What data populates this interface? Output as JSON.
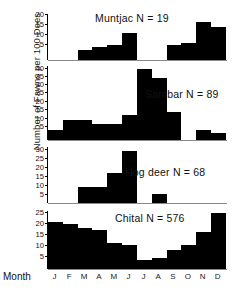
{
  "axis": {
    "ylabel": "Number of Fawns per 100 Does",
    "month_label": "Month",
    "months": [
      "J",
      "F",
      "M",
      "A",
      "M",
      "J",
      "J",
      "A",
      "S",
      "O",
      "N",
      "D"
    ]
  },
  "chart_data": {
    "type": "bar",
    "title": "",
    "xlabel": "Month",
    "ylabel": "Number of Fawns per 100 Does",
    "grid": false,
    "legend": "none",
    "categories": [
      "J",
      "F",
      "M",
      "A",
      "M",
      "J",
      "J",
      "A",
      "S",
      "O",
      "N",
      "D"
    ],
    "panels": [
      {
        "name": "Muntjac",
        "label": "Muntjac N = 19",
        "n": 19,
        "ylim": [
          0,
          22
        ],
        "yticks": [
          5,
          10,
          15,
          20
        ],
        "ytick_labels": [
          "5",
          "10",
          "15",
          "20"
        ],
        "values": [
          0,
          0,
          5,
          6,
          7,
          13,
          0,
          0,
          7,
          8,
          18,
          16
        ]
      },
      {
        "name": "Sambar",
        "label": "Sambar N = 89",
        "n": 89,
        "ylim": [
          0,
          45
        ],
        "yticks": [
          5,
          10,
          15,
          20,
          25,
          30,
          35,
          40
        ],
        "ytick_labels": [
          "5",
          "10",
          "15",
          "20",
          "25",
          "30",
          "35",
          "40"
        ],
        "values": [
          6,
          12,
          12,
          10,
          10,
          15,
          43,
          38,
          17,
          0,
          6,
          4
        ]
      },
      {
        "name": "Hog deer",
        "label": "Hog deer N = 68",
        "n": 68,
        "ylim": [
          0,
          32
        ],
        "yticks": [
          5,
          10,
          15,
          20,
          25,
          30
        ],
        "ytick_labels": [
          "5",
          "10",
          "15",
          "20",
          "25",
          "30"
        ],
        "values": [
          0,
          0,
          9,
          9,
          17,
          30,
          0,
          5,
          0,
          0,
          0,
          0
        ]
      },
      {
        "name": "Chital",
        "label": "Chital N = 576",
        "n": 576,
        "ylim": [
          0,
          27
        ],
        "yticks": [
          5,
          10,
          15,
          20,
          25
        ],
        "ytick_labels": [
          "5",
          "10",
          "15",
          "20",
          "25"
        ],
        "values": [
          22,
          21,
          19,
          18,
          12,
          11,
          4,
          5,
          9,
          11,
          17,
          26
        ]
      }
    ]
  }
}
